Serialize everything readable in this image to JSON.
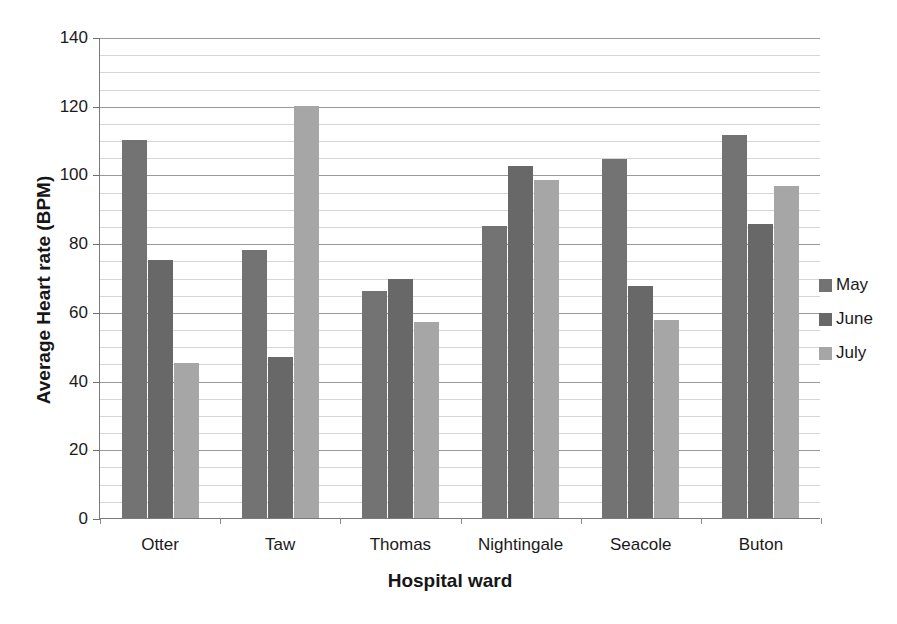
{
  "chart_data": {
    "type": "bar",
    "title": "",
    "xlabel": "Hospital ward",
    "ylabel": "Average Heart rate (BPM)",
    "categories": [
      "Otter",
      "Taw",
      "Thomas",
      "Nightingale",
      "Seacole",
      "Buton"
    ],
    "series": [
      {
        "name": "May",
        "color": "#737373",
        "values": [
          110,
          78,
          66,
          85,
          104.5,
          111.5
        ]
      },
      {
        "name": "June",
        "color": "#686868",
        "values": [
          75,
          47,
          69.5,
          102.5,
          67.5,
          85.5
        ]
      },
      {
        "name": "July",
        "color": "#a6a6a6",
        "values": [
          45,
          120,
          57,
          98.5,
          57.5,
          96.5
        ]
      }
    ],
    "ylim": [
      0,
      140
    ],
    "y_ticks": [
      0,
      20,
      40,
      60,
      80,
      100,
      120,
      140
    ],
    "y_tick_labels": [
      "0",
      "20",
      "40",
      "60",
      "80",
      "100",
      "120",
      "140"
    ],
    "minor_tick_step": 5,
    "grid": true,
    "grid_axis": "y",
    "legend_position": "right",
    "legend_entries": [
      "May",
      "June",
      "July"
    ],
    "bar_orientation": "vertical"
  },
  "colors": {
    "may": "#737373",
    "june": "#686868",
    "july": "#a6a6a6",
    "axis": "#7a7a7a",
    "major_grid": "#9a9a9a",
    "minor_grid": "#d6d6d6",
    "text": "#1a1a1a",
    "background": "#ffffff"
  }
}
